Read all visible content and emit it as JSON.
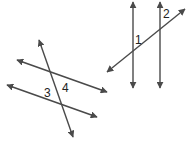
{
  "diagram": {
    "colors": {
      "line": "#4a4a4a",
      "label": "#222222",
      "background": "#ffffff"
    },
    "right_figure": {
      "parallel_lines": [
        {
          "id": "v1",
          "x1": 133,
          "y1": 2,
          "x2": 133,
          "y2": 88
        },
        {
          "id": "v2",
          "x1": 160,
          "y1": 2,
          "x2": 160,
          "y2": 88
        }
      ],
      "transversal": {
        "x1": 107,
        "y1": 72,
        "x2": 185,
        "y2": 9
      },
      "labels": [
        {
          "id": "angle-1",
          "text": "1",
          "x": 135,
          "y": 44
        },
        {
          "id": "angle-2",
          "text": "2",
          "x": 163,
          "y": 18
        }
      ]
    },
    "left_figure": {
      "parallel_lines": [
        {
          "id": "p1",
          "x1": 17,
          "y1": 60,
          "x2": 107,
          "y2": 92
        },
        {
          "id": "p2",
          "x1": 7,
          "y1": 85,
          "x2": 97,
          "y2": 117
        }
      ],
      "transversal": {
        "x1": 39,
        "y1": 40,
        "x2": 73,
        "y2": 137
      },
      "labels": [
        {
          "id": "angle-3",
          "text": "3",
          "x": 44,
          "y": 97
        },
        {
          "id": "angle-4",
          "text": "4",
          "x": 62,
          "y": 92
        }
      ]
    }
  }
}
